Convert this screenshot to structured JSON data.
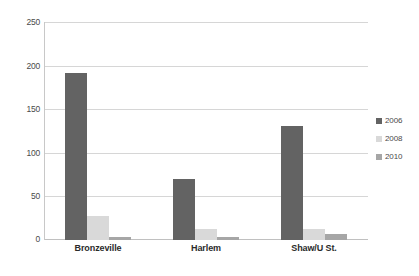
{
  "chart_data": {
    "type": "bar",
    "title": "",
    "xlabel": "",
    "ylabel": "",
    "categories": [
      "Bronzeville",
      "Harlem",
      "Shaw/U St."
    ],
    "series": [
      {
        "name": "2006",
        "color": "#636363",
        "values": [
          192,
          70,
          131
        ]
      },
      {
        "name": "2008",
        "color": "#d9d9d9",
        "values": [
          28,
          13,
          13
        ]
      },
      {
        "name": "2010",
        "color": "#a6a6a6",
        "values": [
          3,
          4,
          7
        ]
      }
    ],
    "ylim": [
      0,
      250
    ],
    "yticks": [
      250,
      200,
      150,
      100,
      50,
      0
    ],
    "ytick_labels": [
      "250",
      "200",
      "150",
      "100",
      "50",
      "0"
    ],
    "grid": true,
    "legend_position": "right",
    "legend_entries": [
      "2006",
      "2008",
      "2010"
    ]
  },
  "axis": {
    "tick_250": "250",
    "tick_200": "200",
    "tick_150": "150",
    "tick_100": "100",
    "tick_50": "50",
    "tick_0": "0"
  },
  "categories": {
    "c0": "Bronzeville",
    "c1": "Harlem",
    "c2": "Shaw/U St."
  },
  "legend": {
    "e0": "2006",
    "e1": "2008",
    "e2": "2010"
  }
}
